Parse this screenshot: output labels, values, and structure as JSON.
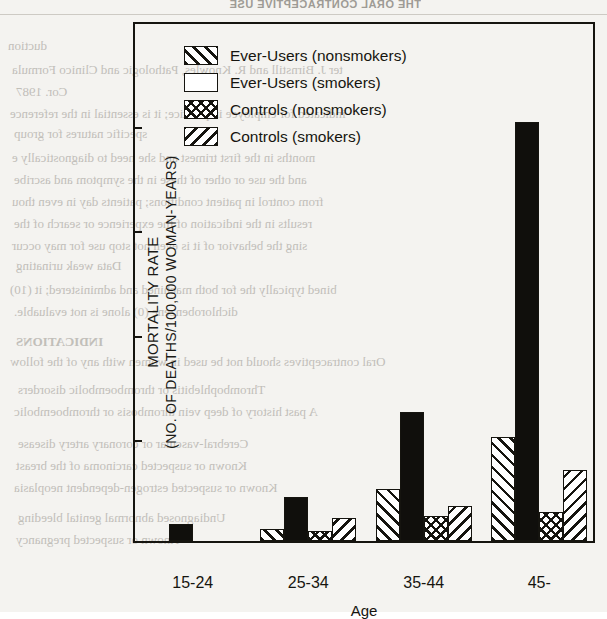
{
  "page": {
    "header_ghost": "THE ORAL CONTRACEPTIVE USE",
    "bleed_through_lines": [
      {
        "text": "duction",
        "x": 8,
        "y": 38,
        "size": 13,
        "bold": false
      },
      {
        "text": "ter J. Birnstill and R. Knowles, Pathologic and Clinico Formula",
        "x": 12,
        "y": 62,
        "size": 13,
        "bold": false
      },
      {
        "text": "Cor. 1987",
        "x": 16,
        "y": 84,
        "size": 13,
        "bold": false
      },
      {
        "text": "indicated for employee in practice; it is essential in the reference",
        "x": 10,
        "y": 106,
        "size": 13,
        "bold": false
      },
      {
        "text": "specific natures for group",
        "x": 14,
        "y": 126,
        "size": 13,
        "bold": false
      },
      {
        "text": "months in the first trimest and she need to diagnostically e",
        "x": 12,
        "y": 150,
        "size": 13,
        "bold": false
      },
      {
        "text": "and the use or other of these in the symptom and ascribe",
        "x": 14,
        "y": 172,
        "size": 13,
        "bold": false
      },
      {
        "text": "from control in patient conditions; patients day in even thou",
        "x": 12,
        "y": 194,
        "size": 13,
        "bold": false
      },
      {
        "text": "results in the indication of the experience or search of the",
        "x": 14,
        "y": 216,
        "size": 13,
        "bold": false
      },
      {
        "text": "sing the behavior of it is even not stop use for may occur",
        "x": 12,
        "y": 238,
        "size": 13,
        "bold": false
      },
      {
        "text": "Data weak urinating",
        "x": 16,
        "y": 258,
        "size": 13,
        "bold": false
      },
      {
        "text": "bined typically the for both machined and administered; it (10)",
        "x": 10,
        "y": 282,
        "size": 13,
        "bold": false
      },
      {
        "text": "dichlorobenzene (0) alone is not evaluable.",
        "x": 14,
        "y": 304,
        "size": 13,
        "bold": false
      },
      {
        "text": "INDICATIONS",
        "x": 16,
        "y": 334,
        "size": 13,
        "bold": true
      },
      {
        "text": "Oral contraceptives should not be used in women with any of the follow",
        "x": 10,
        "y": 354,
        "size": 13,
        "bold": false
      },
      {
        "text": "Thrombophlebitis or thromboembolic disorders",
        "x": 18,
        "y": 382,
        "size": 13,
        "bold": false
      },
      {
        "text": "A past history of deep vein thrombosis or thromboembolic",
        "x": 14,
        "y": 404,
        "size": 13,
        "bold": false
      },
      {
        "text": "Cerebral-vascular or coronary artery disease",
        "x": 18,
        "y": 436,
        "size": 13,
        "bold": false
      },
      {
        "text": "Known or suspected carcinoma of the breast",
        "x": 16,
        "y": 458,
        "size": 13,
        "bold": false
      },
      {
        "text": "Known or suspected estrogen-dependent neoplasia",
        "x": 14,
        "y": 480,
        "size": 13,
        "bold": false
      },
      {
        "text": "Undiagnosed abnormal genital bleeding",
        "x": 18,
        "y": 510,
        "size": 13,
        "bold": false
      },
      {
        "text": "Known or suspected pregnancy",
        "x": 16,
        "y": 532,
        "size": 13,
        "bold": false
      }
    ]
  },
  "chart_data": {
    "type": "bar",
    "title": "",
    "xlabel": "Age",
    "ylabel": "MORTALITY RATE",
    "ylabel_line2": "(NO. OF DEATHS/100,000 WOMAN-YEARS)",
    "ylim": [
      0,
      250
    ],
    "yticks": [
      0,
      50,
      100,
      150,
      200,
      250
    ],
    "grid": false,
    "legend_position": "upper-left-inside",
    "categories": [
      "15-24",
      "25-34",
      "35-44",
      "45-"
    ],
    "series": [
      {
        "name": "Ever-Users (nonsmokers)",
        "pattern": "forward-diagonal-hatch",
        "values": [
          0,
          6,
          25,
          50
        ]
      },
      {
        "name": "Ever-Users (smokers)",
        "pattern": "solid-black",
        "values": [
          8,
          21,
          62,
          201
        ]
      },
      {
        "name": "Controls (nonsmokers)",
        "pattern": "crosshatch",
        "values": [
          0,
          5,
          12,
          14
        ]
      },
      {
        "name": "Controls (smokers)",
        "pattern": "backward-diagonal-hatch",
        "values": [
          0,
          11,
          17,
          34
        ]
      }
    ]
  },
  "colors": {
    "ink": "#15140f",
    "paper": "#f4f3f0",
    "bar_fill": "#ffffff",
    "solid_bar": "#100f0c",
    "ghost_text": "#b9b6b0"
  }
}
